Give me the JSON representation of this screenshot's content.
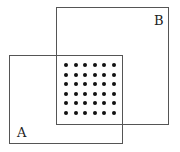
{
  "diagram": {
    "type": "set-overlap",
    "rects": [
      {
        "id": "A",
        "label": "A",
        "x": 9,
        "y": 55,
        "w": 114,
        "h": 89
      },
      {
        "id": "B",
        "label": "B",
        "x": 56,
        "y": 7,
        "w": 113,
        "h": 118
      }
    ],
    "intersection_dots": {
      "rows": 6,
      "cols": 6,
      "x0": 66,
      "y0": 65,
      "dx": 9.5,
      "dy": 9.5
    }
  }
}
